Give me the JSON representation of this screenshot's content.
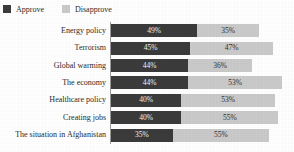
{
  "legend": {
    "items": [
      {
        "label": "Approve",
        "color": "#3b3b3b",
        "icon": "square-swatch-icon"
      },
      {
        "label": "Disapprove",
        "color": "#cacaca",
        "icon": "square-swatch-icon"
      }
    ]
  },
  "chart_data": {
    "type": "bar",
    "orientation": "horizontal",
    "stacked": true,
    "title": "",
    "subtitle": "",
    "xlabel": "",
    "ylabel": "",
    "grid": false,
    "legend_position": "top-left",
    "xlim": [
      0,
      100
    ],
    "axis_unit": "percent",
    "categories": [
      "Energy policy",
      "Terrorism",
      "Global warming",
      "The economy",
      "Healthcare policy",
      "Creating jobs",
      "The situation in Afghanistan"
    ],
    "series": [
      {
        "name": "Approve",
        "color": "#3b3b3b",
        "values": [
          49,
          45,
          44,
          44,
          40,
          40,
          35
        ],
        "labels": [
          "49%",
          "45%",
          "44%",
          "44%",
          "40%",
          "40%",
          "35%"
        ]
      },
      {
        "name": "Disapprove",
        "color": "#cacaca",
        "values": [
          35,
          47,
          36,
          53,
          53,
          55,
          55
        ],
        "labels": [
          "35%",
          "47%",
          "36%",
          "53%",
          "53%",
          "55%",
          "55%"
        ]
      }
    ],
    "rows": [
      {
        "category": "Energy policy",
        "approve": 49,
        "approve_label": "49%",
        "disapprove": 35,
        "disapprove_label": "35%"
      },
      {
        "category": "Terrorism",
        "approve": 45,
        "approve_label": "45%",
        "disapprove": 47,
        "disapprove_label": "47%"
      },
      {
        "category": "Global warming",
        "approve": 44,
        "approve_label": "44%",
        "disapprove": 36,
        "disapprove_label": "36%"
      },
      {
        "category": "The economy",
        "approve": 44,
        "approve_label": "44%",
        "disapprove": 53,
        "disapprove_label": "53%"
      },
      {
        "category": "Healthcare policy",
        "approve": 40,
        "approve_label": "40%",
        "disapprove": 53,
        "disapprove_label": "53%"
      },
      {
        "category": "Creating jobs",
        "approve": 40,
        "approve_label": "40%",
        "disapprove": 55,
        "disapprove_label": "55%"
      },
      {
        "category": "The situation in Afghanistan",
        "approve": 35,
        "approve_label": "35%",
        "disapprove": 55,
        "disapprove_label": "55%"
      }
    ]
  },
  "layout": {
    "axis_color": "#9a9a9a",
    "background": "#ffffff"
  }
}
